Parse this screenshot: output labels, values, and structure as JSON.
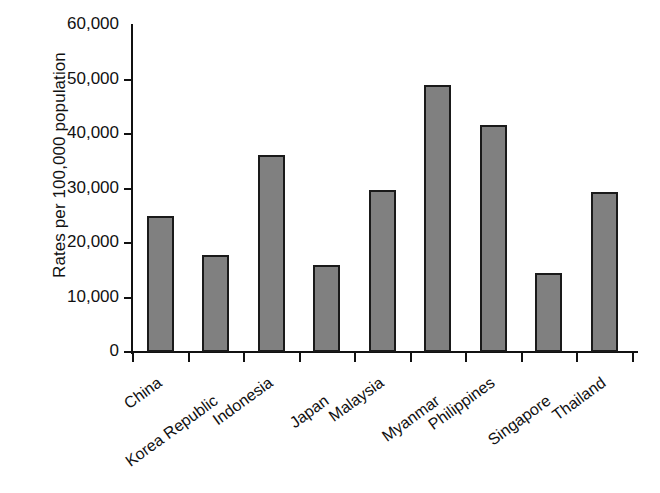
{
  "chart_data": {
    "type": "bar",
    "title": "",
    "xlabel": "",
    "ylabel": "Rates per 100,000 population",
    "ylim": [
      0,
      60000
    ],
    "grid": false,
    "legend": false,
    "categories": [
      "China",
      "Korea Republic",
      "Indonesia",
      "Japan",
      "Malaysia",
      "Myanmar",
      "Philippines",
      "Singapore",
      "Thailand"
    ],
    "values": [
      24900,
      17800,
      36100,
      16000,
      29700,
      49000,
      41700,
      14500,
      29400
    ],
    "y_ticks": [
      0,
      10000,
      20000,
      30000,
      40000,
      50000,
      60000
    ],
    "y_tick_labels": [
      "0",
      "10,000",
      "20,000",
      "30,000",
      "40,000",
      "50,000",
      "60,000"
    ],
    "bar_color": "#808080",
    "bar_edge_color": "#1a1a1a",
    "axis_color": "#111111",
    "background_color": "#ffffff"
  }
}
